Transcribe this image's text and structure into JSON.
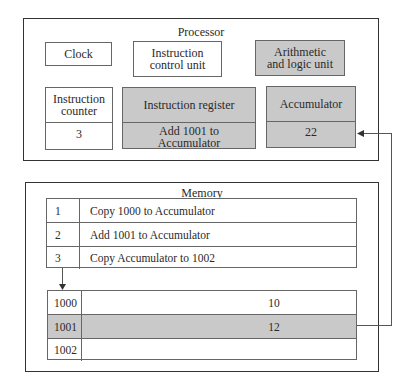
{
  "processor": {
    "title": "Processor",
    "clock": "Clock",
    "instruction_control_unit": "Instruction control unit",
    "alu": "Arithmetic and logic unit",
    "instruction_counter": {
      "label": "Instruction counter",
      "value": "3"
    },
    "instruction_register": {
      "label": "Instruction register",
      "value": "Add 1001 to Accumulator"
    },
    "accumulator": {
      "label": "Accumulator",
      "value": "22"
    }
  },
  "memory": {
    "title": "Memory",
    "program": [
      {
        "num": "1",
        "instruction": "Copy 1000 to Accumulator"
      },
      {
        "num": "2",
        "instruction": "Add 1001 to Accumulator"
      },
      {
        "num": "3",
        "instruction": "Copy Accumulator to 1002"
      }
    ],
    "data": [
      {
        "address": "1000",
        "value": "10",
        "highlighted": false
      },
      {
        "address": "1001",
        "value": "12",
        "highlighted": true
      },
      {
        "address": "1002",
        "value": "",
        "highlighted": false
      }
    ]
  },
  "colors": {
    "highlight": "#c9c9c9",
    "border": "#333333"
  }
}
